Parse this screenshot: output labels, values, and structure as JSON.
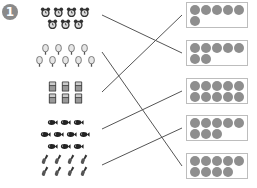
{
  "problem_number": "1",
  "groups": [
    {
      "name": "clocks",
      "icon": "alarm-clock-icon",
      "count": 7,
      "rows": [
        4,
        3
      ],
      "y": 3
    },
    {
      "name": "popsicles",
      "icon": "popsicle-icon",
      "count": 9,
      "rows": [
        4,
        5
      ],
      "y": 40
    },
    {
      "name": "calculators",
      "icon": "calculator-icon",
      "count": 6,
      "rows": [
        3,
        3
      ],
      "y": 77
    },
    {
      "name": "fish",
      "icon": "fish-icon",
      "count": 10,
      "rows": [
        3,
        4,
        3
      ],
      "y": 113
    },
    {
      "name": "shovels",
      "icon": "shovel-icon",
      "count": 8,
      "rows": [
        4,
        4
      ],
      "y": 150
    }
  ],
  "boxes": [
    {
      "count": 6,
      "y": 2
    },
    {
      "count": 7,
      "y": 40
    },
    {
      "count": 10,
      "y": 78
    },
    {
      "count": 8,
      "y": 115
    },
    {
      "count": 9,
      "y": 153
    }
  ],
  "matches": [
    {
      "from": 0,
      "to": 1
    },
    {
      "from": 1,
      "to": 4
    },
    {
      "from": 2,
      "to": 0
    },
    {
      "from": 3,
      "to": 2
    },
    {
      "from": 4,
      "to": 3
    }
  ],
  "colors": {
    "dot": "#8e8e8e",
    "line": "#555555",
    "box_border": "#bdbdbd",
    "badge": "#8a8a8a"
  }
}
